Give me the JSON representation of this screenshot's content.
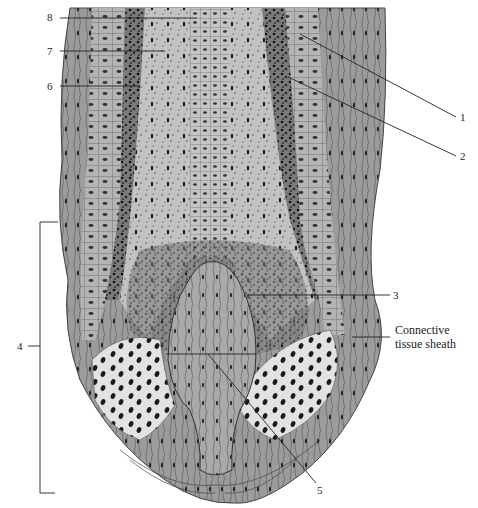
{
  "figure": {
    "labels": {
      "l1": "1",
      "l2": "2",
      "l3": "3",
      "l4": "4",
      "l5": "5",
      "l6": "6",
      "l7": "7",
      "l8": "8",
      "connective_line1": "Connective",
      "connective_line2": "tissue sheath"
    },
    "colors": {
      "tissue_gray": "#a8a8a8",
      "light_gray": "#cfcfcf",
      "pale_matrix": "#dedede",
      "dark_line": "#333333",
      "nuclei": "#1a1a1a",
      "background": "#ffffff"
    }
  }
}
